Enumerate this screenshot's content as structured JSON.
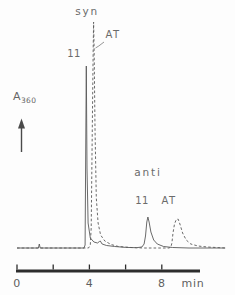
{
  "figure": {
    "type": "chromatogram",
    "ylabel": {
      "base": "A",
      "subscript": "360"
    }
  },
  "chart_data": {
    "type": "line",
    "title": "",
    "xlabel": "time (min)",
    "ylabel": "A360 (arbitrary absorbance units)",
    "x_axis": {
      "range_min": [
        0,
        10.2
      ],
      "tick_positions_min": [
        0,
        2,
        4,
        6,
        8
      ],
      "tick_labels": [
        {
          "t": 0,
          "text": "0"
        },
        {
          "t": 4,
          "text": "4"
        },
        {
          "t": 8,
          "text": "8"
        }
      ],
      "unit_label": "min",
      "unit_label_x_px": 193
    },
    "series": [
      {
        "name": "compound 11 (solid trace)",
        "style": "solid",
        "peaks": [
          {
            "t_min": 3.83,
            "height_au": 182,
            "label": "11 (syn)"
          },
          {
            "t_min": 4.6,
            "height_au": 7,
            "label": "minor impurity"
          },
          {
            "t_min": 7.23,
            "height_au": 31,
            "label": "11 (anti)"
          }
        ],
        "points": [
          [
            0,
            0
          ],
          [
            1.18,
            0
          ],
          [
            1.23,
            4
          ],
          [
            1.28,
            0
          ],
          [
            3.7,
            0
          ],
          [
            3.76,
            3
          ],
          [
            3.79,
            80
          ],
          [
            3.83,
            182
          ],
          [
            3.87,
            80
          ],
          [
            3.93,
            25
          ],
          [
            4.05,
            10
          ],
          [
            4.25,
            6
          ],
          [
            4.45,
            5
          ],
          [
            4.55,
            6.5
          ],
          [
            4.6,
            7
          ],
          [
            4.7,
            4
          ],
          [
            4.95,
            2.5
          ],
          [
            5.4,
            1.5
          ],
          [
            6.0,
            0.6
          ],
          [
            6.6,
            0.3
          ],
          [
            6.9,
            1
          ],
          [
            7.02,
            4
          ],
          [
            7.1,
            12
          ],
          [
            7.17,
            26
          ],
          [
            7.23,
            31
          ],
          [
            7.3,
            26
          ],
          [
            7.4,
            16
          ],
          [
            7.55,
            8
          ],
          [
            7.75,
            4
          ],
          [
            8.1,
            1.5
          ],
          [
            8.6,
            0.5
          ],
          [
            9.5,
            0
          ],
          [
            11.5,
            0
          ]
        ]
      },
      {
        "name": "AT (dashed trace)",
        "style": "dashed",
        "peaks": [
          {
            "t_min": 4.23,
            "height_au": 226,
            "label": "AT (syn)"
          },
          {
            "t_min": 8.9,
            "height_au": 29,
            "label": "AT (anti)"
          }
        ],
        "points": [
          [
            0,
            0
          ],
          [
            3.95,
            0
          ],
          [
            4.05,
            3
          ],
          [
            4.1,
            20
          ],
          [
            4.16,
            120
          ],
          [
            4.21,
            200
          ],
          [
            4.23,
            226
          ],
          [
            4.26,
            200
          ],
          [
            4.31,
            120
          ],
          [
            4.38,
            50
          ],
          [
            4.48,
            25
          ],
          [
            4.62,
            13
          ],
          [
            4.85,
            7
          ],
          [
            5.2,
            3.5
          ],
          [
            5.6,
            1.5
          ],
          [
            6.3,
            0.5
          ],
          [
            7.0,
            0
          ],
          [
            8.4,
            0
          ],
          [
            8.5,
            1
          ],
          [
            8.56,
            5
          ],
          [
            8.62,
            15
          ],
          [
            8.7,
            24
          ],
          [
            8.8,
            28.5
          ],
          [
            8.9,
            29
          ],
          [
            9.0,
            24
          ],
          [
            9.15,
            15
          ],
          [
            9.35,
            8
          ],
          [
            9.6,
            4
          ],
          [
            10.0,
            2
          ],
          [
            10.5,
            1
          ],
          [
            11.0,
            0.5
          ],
          [
            11.5,
            0
          ]
        ]
      }
    ],
    "annotations": [
      {
        "text": "syn",
        "x": 87,
        "y": 5,
        "size": 10.5,
        "spacing": 1.8
      },
      {
        "text": "AT",
        "x": 113,
        "y": 29,
        "size": 10,
        "spacing": 1.5
      },
      {
        "text": "11",
        "x": 74,
        "y": 48,
        "size": 10,
        "spacing": 0.5
      },
      {
        "text": "anti",
        "x": 148,
        "y": 166,
        "size": 10.5,
        "spacing": 1.8
      },
      {
        "text": "11",
        "x": 142,
        "y": 195,
        "size": 10,
        "spacing": 0.5
      },
      {
        "text": "AT",
        "x": 169,
        "y": 195,
        "size": 10,
        "spacing": 1.5
      }
    ],
    "pointer_line": {
      "x1": 104,
      "y1": 42,
      "x2": 95.5,
      "y2": 48
    },
    "layout": {
      "x0_px": 17,
      "px_per_min": 18.1,
      "baseline_y": 248,
      "axis_y": 271,
      "axis_x_start": 16,
      "axis_x_end": 200,
      "tick_h": 5,
      "tick_label_top": 277,
      "legend": "none",
      "grid": false,
      "colors": {
        "trace": "#595959",
        "axis": "#2d2d2d",
        "text": "#6b6b6b",
        "background": "#fdfdfd"
      }
    }
  }
}
